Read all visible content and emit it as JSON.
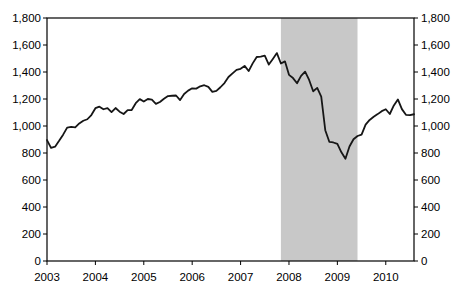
{
  "chart_data": {
    "type": "line",
    "title": "",
    "xlabel": "",
    "ylabel": "",
    "frequency": "monthly",
    "x_start": "2003-01",
    "x_end": "2010-08",
    "x_tick_labels": [
      "2003",
      "2004",
      "2005",
      "2006",
      "2007",
      "2008",
      "2009",
      "2010"
    ],
    "x_tick_month_indices": [
      0,
      12,
      24,
      36,
      48,
      60,
      72,
      84
    ],
    "ylim": [
      0,
      1800
    ],
    "y_tick_values": [
      0,
      200,
      400,
      600,
      800,
      1000,
      1200,
      1400,
      1600,
      1800
    ],
    "y_tick_labels": [
      "0",
      "200",
      "400",
      "600",
      "800",
      "1,000",
      "1,200",
      "1,400",
      "1,600",
      "1,800"
    ],
    "y_axis_sides": [
      "left",
      "right"
    ],
    "grid": false,
    "legend": "none",
    "frame": true,
    "line_color": "#161616",
    "shaded_region": {
      "start": "2007-11",
      "end": "2009-06",
      "start_index": 58,
      "end_index": 77,
      "color": "#c8c8c8"
    },
    "series": [
      {
        "name": "",
        "color": "#161616",
        "values": [
          896,
          838,
          847,
          890,
          936,
          988,
          993,
          990,
          1019,
          1039,
          1050,
          1081,
          1132,
          1143,
          1124,
          1133,
          1103,
          1133,
          1106,
          1089,
          1118,
          1118,
          1169,
          1199,
          1181,
          1200,
          1195,
          1164,
          1178,
          1202,
          1222,
          1224,
          1226,
          1192,
          1237,
          1262,
          1279,
          1277,
          1294,
          1302,
          1290,
          1253,
          1260,
          1287,
          1318,
          1363,
          1390,
          1416,
          1424,
          1445,
          1407,
          1464,
          1511,
          1514,
          1521,
          1455,
          1497,
          1540,
          1463,
          1479,
          1379,
          1355,
          1317,
          1371,
          1403,
          1341,
          1257,
          1282,
          1217,
          969,
          883,
          878,
          867,
          805,
          757,
          848,
          902,
          926,
          936,
          1010,
          1045,
          1068,
          1088,
          1110,
          1124,
          1089,
          1152,
          1197,
          1125,
          1083,
          1080,
          1087
        ]
      }
    ]
  }
}
